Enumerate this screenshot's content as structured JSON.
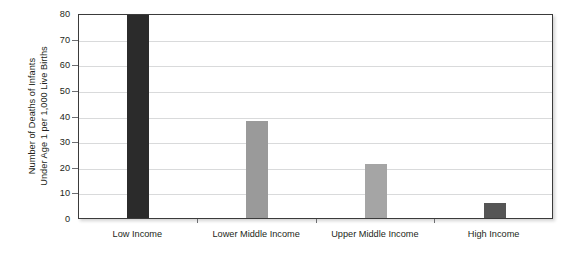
{
  "chart_data": {
    "type": "bar",
    "title": "",
    "xlabel": "",
    "ylabel": "Number of Deaths of Infants Under Age 1 per 1,000 Live Births",
    "ylabel_lines": [
      "Number of Deaths of Infants",
      "Under Age 1 per 1,000 Live Births"
    ],
    "categories": [
      "Low Income",
      "Lower Middle Income",
      "Upper Middle Income",
      "High Income"
    ],
    "values": [
      80,
      38,
      21,
      6
    ],
    "value_notes": [
      "clipped at axis maximum of 80",
      "",
      "",
      ""
    ],
    "bar_colors": [
      "#2b2b2b",
      "#9a9a9a",
      "#a5a5a5",
      "#555555"
    ],
    "ylim": [
      0,
      80
    ],
    "y_ticks": [
      0,
      10,
      20,
      30,
      40,
      50,
      60,
      70,
      80
    ],
    "y_tick_labels": [
      "0",
      "10",
      "20",
      "30",
      "40",
      "50",
      "60",
      "70",
      "80"
    ],
    "grid": true,
    "grid_axis": "y",
    "legend": false,
    "legend_position": "none",
    "plot_background": "#ffffff",
    "grid_color": "#d9dadb",
    "axis_border_color": "#3b3b3b",
    "text_color": "#231f20"
  }
}
